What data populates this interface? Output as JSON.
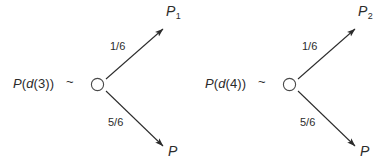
{
  "figure": {
    "background_color": "#ffffff",
    "ink_color": "#2b2b2b",
    "width": 383,
    "height": 164,
    "tilde": "~",
    "node_glyph": "open-circle"
  },
  "diagrams": [
    {
      "id": "left",
      "root_label": {
        "full": "P(d(3))",
        "function": "P",
        "open_paren": "(",
        "inner_function": "d",
        "inner_open_paren": "(",
        "argument": "3",
        "inner_close_paren": ")",
        "close_paren": ")"
      },
      "operator": "~",
      "branches": [
        {
          "direction": "upper",
          "probability": "1/6",
          "target": "P",
          "target_subscript": "1"
        },
        {
          "direction": "lower",
          "probability": "5/6",
          "target": "P",
          "target_subscript": ""
        }
      ]
    },
    {
      "id": "right",
      "root_label": {
        "full": "P(d(4))",
        "function": "P",
        "open_paren": "(",
        "inner_function": "d",
        "inner_open_paren": "(",
        "argument": "4",
        "inner_close_paren": ")",
        "close_paren": ")"
      },
      "operator": "~",
      "branches": [
        {
          "direction": "upper",
          "probability": "1/6",
          "target": "P",
          "target_subscript": "2"
        },
        {
          "direction": "lower",
          "probability": "5/6",
          "target": "P",
          "target_subscript": ""
        }
      ]
    }
  ]
}
